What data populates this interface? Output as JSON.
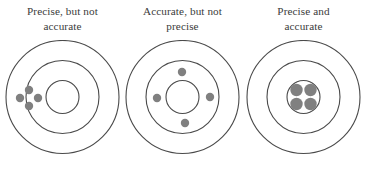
{
  "figure": {
    "name": "accuracy-precision-target-diagram",
    "width": 365,
    "height": 169,
    "background_color": "#ffffff",
    "ring_stroke_color": "#4a4a4a",
    "ring_stroke_width": 1.1,
    "dot_color": "#808080",
    "caption_color": "#3b3b3b"
  },
  "targets": [
    {
      "id": "precise-not-accurate",
      "caption_lines": [
        "Precise, but not",
        "accurate"
      ],
      "center": {
        "x": 60.5,
        "y": 57
      },
      "rings": [
        {
          "name": "outer-ring",
          "r": 56.5
        },
        {
          "name": "middle-ring",
          "r": 36.5
        },
        {
          "name": "inner-ring",
          "r": 16.5
        }
      ],
      "dots": [
        {
          "cx": 27,
          "cy": 50,
          "r": 4.2
        },
        {
          "cx": 18,
          "cy": 58,
          "r": 4.2
        },
        {
          "cx": 36,
          "cy": 58,
          "r": 4.2
        },
        {
          "cx": 27,
          "cy": 66,
          "r": 4.2
        }
      ]
    },
    {
      "id": "accurate-not-precise",
      "caption_lines": [
        "Accurate, but not",
        "precise"
      ],
      "center": {
        "x": 60.5,
        "y": 57
      },
      "rings": [
        {
          "name": "outer-ring",
          "r": 56.5
        },
        {
          "name": "middle-ring",
          "r": 36.5
        },
        {
          "name": "inner-ring",
          "r": 16.5
        }
      ],
      "dots": [
        {
          "cx": 60,
          "cy": 32,
          "r": 4.2
        },
        {
          "cx": 35,
          "cy": 58,
          "r": 4.2
        },
        {
          "cx": 88,
          "cy": 57,
          "r": 4.2
        },
        {
          "cx": 63,
          "cy": 83,
          "r": 4.2
        }
      ]
    },
    {
      "id": "precise-and-accurate",
      "caption_lines": [
        "Precise and",
        "accurate"
      ],
      "center": {
        "x": 60.5,
        "y": 57
      },
      "rings": [
        {
          "name": "outer-ring",
          "r": 56.5
        },
        {
          "name": "middle-ring",
          "r": 36.5
        },
        {
          "name": "inner-ring",
          "r": 16.5
        }
      ],
      "dots": [
        {
          "cx": 53.5,
          "cy": 50,
          "r": 6.2
        },
        {
          "cx": 67.5,
          "cy": 50,
          "r": 6.2
        },
        {
          "cx": 53.5,
          "cy": 64,
          "r": 6.2
        },
        {
          "cx": 67.5,
          "cy": 64,
          "r": 6.2
        }
      ]
    }
  ]
}
